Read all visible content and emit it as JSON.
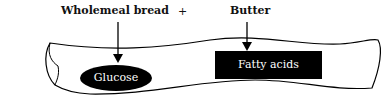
{
  "diagram": {
    "food_left": "Wholemeal bread",
    "plus": "+",
    "food_right": "Butter",
    "product_left": "Glucose",
    "product_right": "Fatty acids",
    "colors": {
      "fill": "#000000",
      "text": "#ffffff",
      "line": "#000000"
    }
  }
}
